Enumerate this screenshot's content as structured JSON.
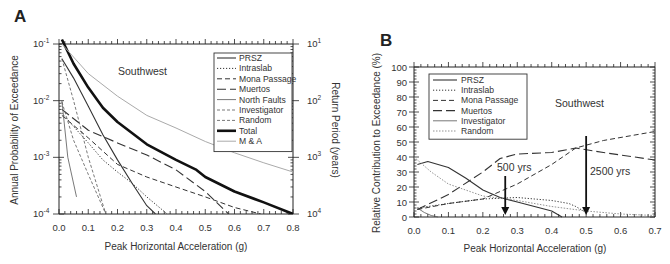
{
  "chart_data": [
    {
      "panel": "A",
      "type": "line",
      "annotation": "Southwest",
      "xlabel": "Peak Horizontal Acceleration (g)",
      "ylabel": "Annual Probability of Exceedance",
      "y2label": "Return Period (years)",
      "xlim": [
        0.0,
        0.8
      ],
      "ylim": [
        0.0001,
        0.1
      ],
      "yscale": "log",
      "xticks": [
        "0.0",
        "0.1",
        "0.2",
        "0.3",
        "0.4",
        "0.5",
        "0.6",
        "0.7",
        "0.8"
      ],
      "yticks": [
        "10-1",
        "10-2",
        "10-3",
        "10-4"
      ],
      "y2ticks": [
        "101",
        "102",
        "103",
        "104"
      ],
      "legend_position": "upper right",
      "series": [
        {
          "name": "PRSZ",
          "style": "solid",
          "x": [
            0.01,
            0.05,
            0.1,
            0.15,
            0.2,
            0.25,
            0.3,
            0.33
          ],
          "y": [
            0.055,
            0.025,
            0.008,
            0.0025,
            0.0009,
            0.00035,
            0.00014,
            0.0001
          ]
        },
        {
          "name": "Intraslab",
          "style": "dotted",
          "x": [
            0.01,
            0.05,
            0.1,
            0.15,
            0.2,
            0.25,
            0.3,
            0.37
          ],
          "y": [
            0.006,
            0.0035,
            0.0018,
            0.0009,
            0.00055,
            0.00035,
            0.0002,
            0.0001
          ]
        },
        {
          "name": "Mona Passage",
          "style": "dashed",
          "x": [
            0.01,
            0.1,
            0.2,
            0.3,
            0.4,
            0.5,
            0.6,
            0.69
          ],
          "y": [
            0.0055,
            0.0022,
            0.00075,
            0.00045,
            0.0003,
            0.0002,
            0.00013,
            0.0001
          ]
        },
        {
          "name": "Muertos",
          "style": "long-dash",
          "x": [
            0.01,
            0.1,
            0.2,
            0.3,
            0.4,
            0.5,
            0.58
          ],
          "y": [
            0.007,
            0.003,
            0.0018,
            0.0011,
            0.0006,
            0.00025,
            0.0001
          ]
        },
        {
          "name": "North Faults",
          "style": "solid-thin",
          "x": [
            0.01,
            0.03,
            0.06
          ],
          "y": [
            0.01,
            0.001,
            0.0002
          ]
        },
        {
          "name": "Investigator",
          "style": "short-dash",
          "x": [
            0.01,
            0.05,
            0.1,
            0.16
          ],
          "y": [
            0.055,
            0.01,
            0.001,
            0.0001
          ]
        },
        {
          "name": "Random",
          "style": "short-dash",
          "x": [
            0.01,
            0.05,
            0.1,
            0.16
          ],
          "y": [
            0.0095,
            0.002,
            0.0005,
            0.0001
          ]
        },
        {
          "name": "Total",
          "style": "thick-solid",
          "x": [
            0.01,
            0.05,
            0.1,
            0.15,
            0.2,
            0.3,
            0.4,
            0.47,
            0.5,
            0.6,
            0.7,
            0.8
          ],
          "y": [
            0.12,
            0.045,
            0.017,
            0.0075,
            0.0042,
            0.0017,
            0.0009,
            0.0006,
            0.00045,
            0.00025,
            0.00016,
            0.0001
          ]
        },
        {
          "name": "M & A",
          "style": "gray-solid",
          "x": [
            0.01,
            0.1,
            0.2,
            0.3,
            0.4,
            0.5,
            0.6,
            0.7,
            0.8
          ],
          "y": [
            0.1,
            0.03,
            0.012,
            0.0055,
            0.0033,
            0.0019,
            0.0012,
            0.0008,
            0.00055
          ]
        }
      ]
    },
    {
      "panel": "B",
      "type": "line",
      "annotation": "Southwest",
      "xlabel": "Peak Horizontal Acceleration (g)",
      "ylabel": "Relative Contribution to Exceedance (%)",
      "xlim": [
        0.0,
        0.7
      ],
      "ylim": [
        0,
        100
      ],
      "xticks": [
        "0.0",
        "0.1",
        "0.2",
        "0.3",
        "0.4",
        "0.5",
        "0.6",
        "0.7"
      ],
      "yticks": [
        "0",
        "10",
        "20",
        "30",
        "40",
        "50",
        "60",
        "70",
        "80",
        "90",
        "100"
      ],
      "legend_position": "upper left",
      "arrows": [
        {
          "label": "500 yrs",
          "x": 0.265
        },
        {
          "label": "2500 yrs",
          "x": 0.5
        }
      ],
      "series": [
        {
          "name": "PRSZ",
          "style": "solid",
          "x": [
            0.01,
            0.04,
            0.1,
            0.15,
            0.2,
            0.25,
            0.3,
            0.35,
            0.4,
            0.43
          ],
          "y": [
            35,
            37,
            33,
            26,
            18,
            13,
            10,
            7,
            4,
            0
          ]
        },
        {
          "name": "Intraslab",
          "style": "dotted",
          "x": [
            0.01,
            0.1,
            0.2,
            0.3,
            0.4,
            0.45,
            0.47,
            0.5
          ],
          "y": [
            6,
            9,
            12,
            13,
            11,
            9,
            7,
            3
          ]
        },
        {
          "name": "Mona Passage",
          "style": "dashed",
          "x": [
            0.01,
            0.1,
            0.2,
            0.3,
            0.4,
            0.47,
            0.55,
            0.7
          ],
          "y": [
            5,
            9,
            12,
            22,
            35,
            46,
            51,
            57
          ]
        },
        {
          "name": "Muertos",
          "style": "long-dash",
          "x": [
            0.01,
            0.1,
            0.2,
            0.25,
            0.3,
            0.4,
            0.47,
            0.55,
            0.7
          ],
          "y": [
            5,
            15,
            30,
            39,
            42,
            43,
            46,
            43,
            38
          ]
        },
        {
          "name": "Investigator",
          "style": "solid-thin",
          "x": [
            0.01,
            0.03,
            0.05,
            0.07
          ],
          "y": [
            6,
            3,
            1,
            0
          ]
        },
        {
          "name": "Random",
          "style": "short-dot",
          "x": [
            0.0,
            0.05,
            0.1,
            0.2,
            0.3,
            0.4,
            0.5,
            0.6,
            0.7
          ],
          "y": [
            40,
            30,
            22,
            14,
            11,
            7,
            4,
            2,
            1
          ]
        }
      ]
    }
  ],
  "labels": {
    "panel_a": "A",
    "panel_b": "B",
    "southwest": "Southwest",
    "xlabel": "Peak Horizontal Acceleration (g)",
    "a_ylabel": "Annual Probability of Exceedance",
    "a_y2label": "Return Period (years)",
    "b_ylabel": "Relative Contribution to Exceedance (%)",
    "arrow_500": "500 yrs",
    "arrow_2500": "2500 yrs"
  }
}
